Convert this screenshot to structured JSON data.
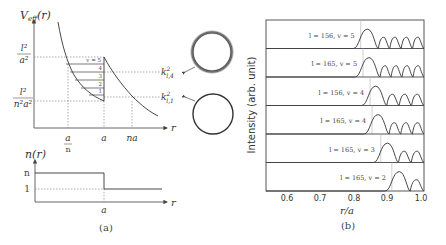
{
  "panel_a": {
    "caption": "(a)",
    "top_plot": {
      "y_label": "V",
      "y_label_sub": "eff",
      "y_label_arg": "(r)",
      "y_tick_high_num": "l²",
      "y_tick_high_den": "a²",
      "y_tick_low_num": "l²",
      "y_tick_low_den": "n²a²",
      "x_label": "r",
      "x_ticks": [
        {
          "label": "a",
          "sub": "n",
          "x": 68
        },
        {
          "label": "a",
          "sub": "",
          "x": 104
        },
        {
          "label": "na",
          "sub": "",
          "x": 132
        }
      ],
      "levels": [
        "v = 5",
        "4",
        "3",
        "2",
        "1"
      ],
      "annotations": [
        {
          "label": "k",
          "sup": "2",
          "sub": "l,4",
          "ring": "fuzzy"
        },
        {
          "label": "k",
          "sup": "2",
          "sub": "l,1",
          "ring": "sharp"
        }
      ]
    },
    "bottom_plot": {
      "y_label": "n(r)",
      "y_ticks": [
        "n",
        "1"
      ],
      "x_label": "r",
      "x_tick": "a"
    }
  },
  "panel_b": {
    "caption": "(b)",
    "y_label": "Intensity (arb. unit)",
    "x_label": "r/a",
    "x_ticks": [
      "0.6",
      "0.7",
      "0.8",
      "0.9",
      "1.0"
    ]
  },
  "chart_data": {
    "type": "line",
    "xlabel": "r/a",
    "ylabel": "Intensity (arb. unit)",
    "xlim": [
      0.54,
      1.0
    ],
    "x_ticks": [
      0.6,
      0.7,
      0.8,
      0.9,
      1.0
    ],
    "series": [
      {
        "name": "l = 156, v = 5",
        "turning_point": 0.82,
        "first_peak": 0.84,
        "peaks": 5
      },
      {
        "name": "l = 165, v = 5",
        "turning_point": 0.827,
        "first_peak": 0.845,
        "peaks": 5
      },
      {
        "name": "l = 156, v = 4",
        "turning_point": 0.848,
        "first_peak": 0.865,
        "peaks": 4
      },
      {
        "name": "l = 165, v = 4",
        "turning_point": 0.854,
        "first_peak": 0.872,
        "peaks": 4
      },
      {
        "name": "l = 165, v = 3",
        "turning_point": 0.88,
        "first_peak": 0.9,
        "peaks": 3
      },
      {
        "name": "l = 165, v = 2",
        "turning_point": 0.913,
        "first_peak": 0.935,
        "peaks": 2
      }
    ]
  }
}
